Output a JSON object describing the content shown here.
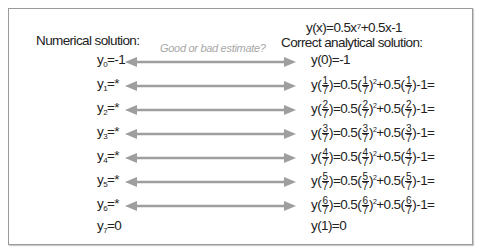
{
  "header": {
    "left_title": "Numerical solution:",
    "equation": "y(x)=0.5x⁷+0.5x-1",
    "right_title": "Correct analytical solution:",
    "hint": "Good or bad estimate?"
  },
  "colors": {
    "arrow": "#9e9e9e",
    "frame": "#9a9a9a",
    "hint": "#a8a8a8"
  },
  "numerical": [
    {
      "sub": "0",
      "value": "=-1"
    },
    {
      "sub": "1",
      "value": "=*"
    },
    {
      "sub": "2",
      "value": "=*"
    },
    {
      "sub": "3",
      "value": "=*"
    },
    {
      "sub": "4",
      "value": "=*"
    },
    {
      "sub": "5",
      "value": "=*"
    },
    {
      "sub": "6",
      "value": "=*"
    },
    {
      "sub": "7",
      "value": "=0"
    }
  ],
  "analytical": {
    "first": "y(0)=-1",
    "last": "y(1)=0",
    "rows": [
      {
        "num": "1",
        "den": "7"
      },
      {
        "num": "2",
        "den": "7"
      },
      {
        "num": "3",
        "den": "7"
      },
      {
        "num": "4",
        "den": "7"
      },
      {
        "num": "5",
        "den": "7"
      },
      {
        "num": "6",
        "den": "7"
      }
    ],
    "parts": {
      "y": "y(",
      "mid1": ")=0.5(",
      "mid2": ")",
      "sq": "2",
      "mid3": "+0.5(",
      "end": ")-1="
    }
  }
}
